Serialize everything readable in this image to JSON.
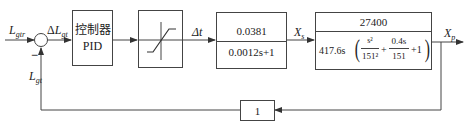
{
  "signals": {
    "input": {
      "main": "L",
      "sub": "gtr"
    },
    "error": {
      "prefix": "Δ",
      "main": "L",
      "sub": "gt"
    },
    "feedback": {
      "main": "L",
      "sub": "gt"
    },
    "delta_t": "Δt",
    "xs": {
      "main": "X",
      "sub": "s"
    },
    "xp": {
      "main": "X",
      "sub": "p"
    },
    "minus_sign": "−"
  },
  "blocks": {
    "controller": {
      "line1": "控制器",
      "line2": "PID"
    },
    "saturation": {
      "icon": "saturation-curve-icon"
    },
    "actuator": {
      "numerator": "0.0381",
      "denominator": "0.0012s+1"
    },
    "plant": {
      "numerator": "27400",
      "denominator_prefix": "417.6s",
      "term1_num": "s²",
      "term1_den": "151²",
      "plus1": "+",
      "term2_num": "0.4s",
      "term2_den": "151",
      "plus_one": "+1"
    },
    "feedback_gain": {
      "value": "1"
    }
  },
  "colors": {
    "line": "#444444",
    "background": "#ffffff"
  }
}
